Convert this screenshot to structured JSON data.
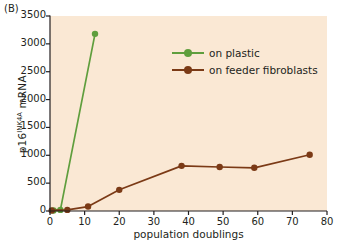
{
  "panel": {
    "label": "(B)"
  },
  "colors": {
    "plot_background": "#fae8d4",
    "page_background": "#ffffff",
    "plastic": "#5f9e3d",
    "feeder": "#7b3a16",
    "axis": "#231f20",
    "text": "#231f20"
  },
  "legend": {
    "position": "inside-top-right",
    "entries": [
      {
        "label": "on plastic",
        "color": "#5f9e3d",
        "marker": "circle"
      },
      {
        "label": "on feeder fibroblasts",
        "color": "#7b3a16",
        "marker": "circle"
      }
    ]
  },
  "axes": {
    "x": {
      "label": "population doublings",
      "ticks": [
        0,
        10,
        20,
        30,
        40,
        50,
        60,
        70,
        80
      ],
      "tick_labels": [
        "0",
        "10",
        "20",
        "30",
        "40",
        "50",
        "60",
        "70",
        "80"
      ],
      "min": 0,
      "max": 80
    },
    "y": {
      "label_main": "p16",
      "label_sup": "INK4A",
      "label_tail": " mRNA",
      "ticks": [
        0,
        500,
        1000,
        1500,
        2000,
        2500,
        3000,
        3500
      ],
      "tick_labels": [
        "0",
        "500",
        "1000",
        "1500",
        "2000",
        "2500",
        "3000",
        "3500"
      ],
      "min": 0,
      "max": 3500
    }
  },
  "chart_data": {
    "type": "line",
    "title": "",
    "subtitle": "",
    "xlabel": "population doublings",
    "ylabel": "p16INK4A mRNA",
    "xlim": [
      0,
      80
    ],
    "ylim": [
      0,
      3500
    ],
    "grid": false,
    "legend_position": "inside-top-right",
    "annotations": [
      "(B)"
    ],
    "series": [
      {
        "name": "on plastic",
        "color": "#5f9e3d",
        "marker": "circle",
        "x": [
          1,
          3,
          13
        ],
        "y": [
          10,
          20,
          3180
        ]
      },
      {
        "name": "on feeder fibroblasts",
        "color": "#7b3a16",
        "marker": "circle",
        "x": [
          0.5,
          5,
          11,
          20,
          38,
          49,
          59,
          75
        ],
        "y": [
          10,
          20,
          80,
          380,
          810,
          790,
          775,
          1010
        ]
      }
    ]
  }
}
